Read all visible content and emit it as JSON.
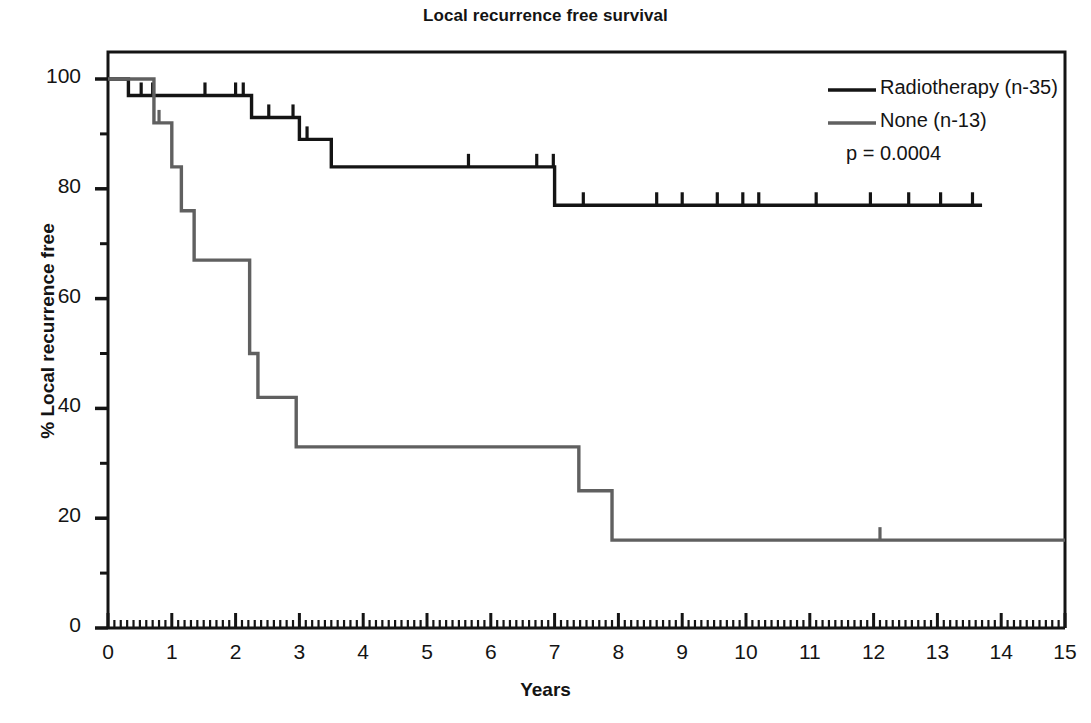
{
  "chart_data": {
    "type": "line",
    "subtype": "kaplan-meier-step",
    "title": "Local recurrence free survival",
    "xlabel": "Years",
    "ylabel": "% Local recurrence free",
    "xlim": [
      0,
      15
    ],
    "ylim": [
      0,
      104
    ],
    "xticks": [
      0,
      1,
      2,
      3,
      4,
      5,
      6,
      7,
      8,
      9,
      10,
      11,
      12,
      13,
      14,
      15
    ],
    "xtick_labels": [
      "0",
      "1",
      "2",
      "3",
      "4",
      "5",
      "6",
      "7",
      "8",
      "9",
      "10",
      "11",
      "12",
      "13",
      "14",
      "15"
    ],
    "yticks": [
      0,
      20,
      40,
      60,
      80,
      100
    ],
    "ytick_labels": [
      "0",
      "20",
      "40",
      "60",
      "80",
      "100"
    ],
    "yminor_ticks": [
      10,
      30,
      50,
      70,
      90
    ],
    "grid": false,
    "legend_position": "top-right",
    "annotations": [
      {
        "text": "p = 0.0004",
        "value": 0.0004,
        "label": "p-value"
      }
    ],
    "series": [
      {
        "name": "Radiotherapy (n-35)",
        "group": "Radiotherapy",
        "n": 35,
        "color": "#141414",
        "steps": [
          {
            "x": 0.0,
            "y": 100
          },
          {
            "x": 0.32,
            "y": 97
          },
          {
            "x": 2.25,
            "y": 93
          },
          {
            "x": 3.0,
            "y": 89
          },
          {
            "x": 3.5,
            "y": 84
          },
          {
            "x": 7.0,
            "y": 77
          },
          {
            "x": 13.7,
            "y": 77
          }
        ],
        "censor_times": [
          0.52,
          0.7,
          1.52,
          2.0,
          2.12,
          2.52,
          2.9,
          3.12,
          5.65,
          6.72,
          6.98,
          7.45,
          8.6,
          9.0,
          9.55,
          9.95,
          10.2,
          11.1,
          11.95,
          12.55,
          13.05,
          13.55
        ],
        "end_x": 13.7,
        "final_value": 77
      },
      {
        "name": "None (n-13)",
        "group": "None",
        "n": 13,
        "color": "#606060",
        "steps": [
          {
            "x": 0.0,
            "y": 100
          },
          {
            "x": 0.72,
            "y": 92
          },
          {
            "x": 1.0,
            "y": 84
          },
          {
            "x": 1.15,
            "y": 76
          },
          {
            "x": 1.35,
            "y": 67
          },
          {
            "x": 2.22,
            "y": 50
          },
          {
            "x": 2.35,
            "y": 42
          },
          {
            "x": 2.95,
            "y": 33
          },
          {
            "x": 7.38,
            "y": 25
          },
          {
            "x": 7.9,
            "y": 16
          },
          {
            "x": 15.0,
            "y": 16
          }
        ],
        "censor_times": [
          0.8,
          12.1
        ],
        "end_x": 15.0,
        "final_value": 16
      }
    ]
  },
  "legend": {
    "items": [
      {
        "label": "Radiotherapy (n-35)",
        "color": "#141414"
      },
      {
        "label": "None (n-13)",
        "color": "#606060"
      }
    ],
    "pvalue": "p = 0.0004"
  },
  "axes": {
    "title": "Local recurrence free survival",
    "x_title": "Years",
    "y_title": "% Local recurrence free"
  }
}
